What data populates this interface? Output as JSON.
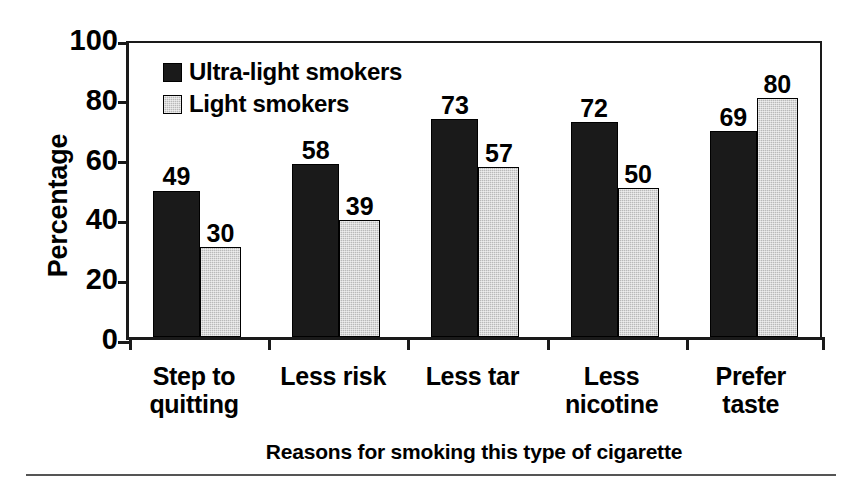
{
  "chart_data": {
    "type": "bar",
    "title": "",
    "xlabel": "Reasons for smoking this type of cigarette",
    "ylabel": "Percentage",
    "ylim": [
      0,
      100
    ],
    "yticks": [
      0,
      20,
      40,
      60,
      80,
      100
    ],
    "grid": false,
    "legend_position": "top-left inside plot",
    "categories": [
      "Step to quitting",
      "Less risk",
      "Less tar",
      "Less nicotine",
      "Prefer taste"
    ],
    "category_lines": [
      [
        "Step to",
        "quitting"
      ],
      [
        "Less risk",
        ""
      ],
      [
        "Less tar",
        ""
      ],
      [
        "Less",
        "nicotine"
      ],
      [
        "Prefer",
        "taste"
      ]
    ],
    "series": [
      {
        "name": "Ultra-light smokers",
        "color": "#1a1a1a",
        "values": [
          49,
          58,
          73,
          72,
          69
        ]
      },
      {
        "name": "Light smokers",
        "color": "#b9b9b9",
        "values": [
          30,
          39,
          57,
          50,
          80
        ]
      }
    ]
  },
  "axis": {
    "y_title": "Percentage",
    "y_tick_labels": [
      "100",
      "80",
      "60",
      "40",
      "20",
      "0"
    ],
    "x_title": "Reasons for smoking this type of cigarette"
  },
  "legend": {
    "items": [
      {
        "label": "Ultra-light smokers",
        "swatch": "dark"
      },
      {
        "label": "Light smokers",
        "swatch": "light"
      }
    ]
  }
}
